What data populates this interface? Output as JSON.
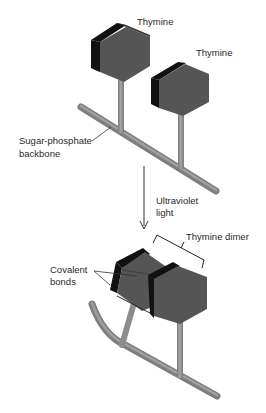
{
  "diagram": {
    "type": "molecular-schematic",
    "labels": {
      "thymine_1": "Thymine",
      "thymine_2": "Thymine",
      "backbone_line1": "Sugar-phosphate",
      "backbone_line2": "backbone",
      "uv_line1": "Ultraviolet",
      "uv_line2": "light",
      "dimer": "Thymine dimer",
      "bonds_line1": "Covalent",
      "bonds_line2": "bonds"
    },
    "colors": {
      "base_face": "#555555",
      "base_edge": "#111111",
      "rod": "#8c8c8c",
      "rod_highlight": "#a8a8a8",
      "line": "#333333",
      "background": "#ffffff"
    }
  }
}
